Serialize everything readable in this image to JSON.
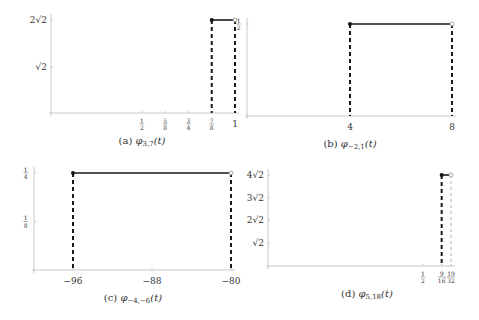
{
  "chart_data": [
    {
      "id": "a",
      "type": "line",
      "title": "(a) φ_{3,7}(t)",
      "caption_prefix": "(a)",
      "caption_fn": "φ",
      "caption_sub": "3,7",
      "caption_arg": "(t)",
      "xlabel": "",
      "ylabel": "",
      "x_ticks": [
        {
          "value": 0.5,
          "label": "1/2"
        },
        {
          "value": 0.625,
          "label": "5/8"
        },
        {
          "value": 0.75,
          "label": "3/4"
        },
        {
          "value": 0.875,
          "label": "7/8"
        },
        {
          "value": 1,
          "label": "1"
        }
      ],
      "y_ticks": [
        {
          "value": 1.41421,
          "label": "√2"
        },
        {
          "value": 2.82843,
          "label": "2√2"
        }
      ],
      "segment": {
        "x_start": 0.875,
        "x_end": 1,
        "y": 2.82843,
        "closed_start": true,
        "open_end": true
      },
      "dashed_verticals": [
        0.875,
        1
      ],
      "xlim": [
        0,
        1
      ],
      "ylim": [
        0,
        2.82843
      ],
      "px": {
        "x0": 51,
        "y0": 113,
        "xa": 142,
        "va": 0.5,
        "xb": 235,
        "vb": 1,
        "ya": 67,
        "wa": 1.41421,
        "yb": 20,
        "wb": 2.82843
      }
    },
    {
      "id": "b",
      "type": "line",
      "title": "(b) φ_{-2,1}(t)",
      "caption_prefix": "(b)",
      "caption_fn": "φ",
      "caption_sub": "−2,1",
      "caption_arg": "(t)",
      "xlabel": "",
      "ylabel": "",
      "x_ticks": [
        {
          "value": 4,
          "label": "4"
        },
        {
          "value": 8,
          "label": "8"
        }
      ],
      "y_ticks": [
        {
          "value": 0.5,
          "label": "1/2"
        }
      ],
      "segment": {
        "x_start": 4,
        "x_end": 8,
        "y": 0.5,
        "closed_start": true,
        "open_end": true
      },
      "dashed_verticals": [
        4,
        8
      ],
      "xlim": [
        0,
        8
      ],
      "ylim": [
        0,
        0.5
      ],
      "px": {
        "x0": 247,
        "y0": 116,
        "xa": 350,
        "va": 4,
        "xb": 452,
        "vb": 8,
        "ya": 116,
        "wa": 0,
        "yb": 24,
        "wb": 0.5
      }
    },
    {
      "id": "c",
      "type": "line",
      "title": "(c) φ_{-4,-6}(t)",
      "caption_prefix": "(c)",
      "caption_fn": "φ",
      "caption_sub": "−4,−6",
      "caption_arg": "(t)",
      "xlabel": "",
      "ylabel": "",
      "x_ticks": [
        {
          "value": -96,
          "label": "−96"
        },
        {
          "value": -88,
          "label": "−88"
        },
        {
          "value": -80,
          "label": "−80"
        }
      ],
      "y_ticks": [
        {
          "value": 0.125,
          "label": "1/8"
        },
        {
          "value": 0.25,
          "label": "1/4"
        }
      ],
      "segment": {
        "x_start": -96,
        "x_end": -80,
        "y": 0.25,
        "closed_start": true,
        "open_end": true
      },
      "dashed_verticals": [
        -96,
        -80
      ],
      "xlim": [
        -100,
        -80
      ],
      "ylim": [
        0,
        0.25
      ],
      "px": {
        "x0": 34,
        "y0": 270,
        "xa": 73,
        "va": -96,
        "xb": 231,
        "vb": -80,
        "ya": 270,
        "wa": 0,
        "yb": 173,
        "wb": 0.25
      }
    },
    {
      "id": "d",
      "type": "line",
      "title": "(d) φ_{5,18}(t)",
      "caption_prefix": "(d)",
      "caption_fn": "φ",
      "caption_sub": "5,18",
      "caption_arg": "(t)",
      "xlabel": "",
      "ylabel": "",
      "x_ticks": [
        {
          "value": 0.5,
          "label": "1/2"
        },
        {
          "value": 0.5625,
          "label": "9/16"
        },
        {
          "value": 0.59375,
          "label": "19/32"
        }
      ],
      "y_ticks": [
        {
          "value": 1.41421,
          "label": "√2"
        },
        {
          "value": 2.82843,
          "label": "2√2"
        },
        {
          "value": 4.24264,
          "label": "3√2"
        },
        {
          "value": 5.65685,
          "label": "4√2"
        }
      ],
      "segment": {
        "x_start": 0.5625,
        "x_end": 0.59375,
        "y": 5.65685,
        "closed_start": true,
        "open_end": true
      },
      "dashed_verticals": [
        0.5625,
        0.59375
      ],
      "xlim": [
        0,
        0.59375
      ],
      "ylim": [
        0,
        5.65685
      ],
      "px": {
        "x0": 268,
        "y0": 266,
        "xa": 423,
        "va": 0.5,
        "xb": 451,
        "vb": 0.59375,
        "ya": 243,
        "wa": 1.41421,
        "yb": 175,
        "wb": 5.65685
      }
    }
  ]
}
